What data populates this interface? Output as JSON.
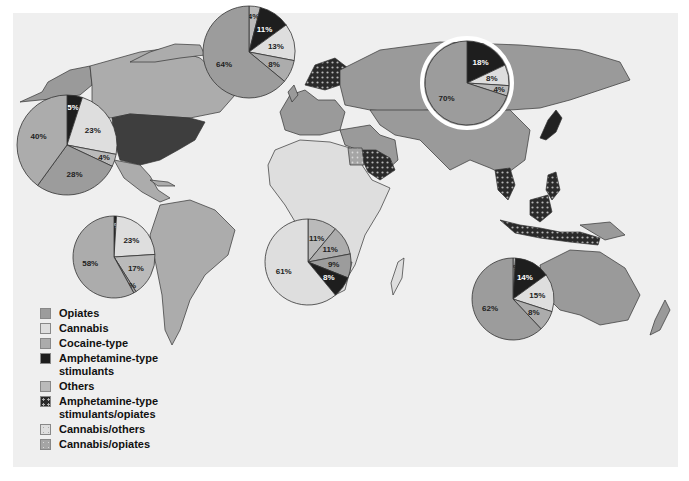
{
  "colors": {
    "background": "#efefef",
    "opiates": "#9c9c9c",
    "cannabis": "#dedede",
    "cocaine": "#acacac",
    "amphetamine": "#1e1e1e",
    "others": "#bababa",
    "ocean": "#efefef",
    "border": "#333333",
    "highlight_ring": "#ffffff"
  },
  "legend": {
    "items": [
      {
        "label": "Opiates",
        "swatch": "opiates"
      },
      {
        "label": "Cannabis",
        "swatch": "cannabis"
      },
      {
        "label": "Cocaine-type",
        "swatch": "cocaine"
      },
      {
        "label": "Amphetamine-type stimulants",
        "line1": "Amphetamine-type",
        "line2": "stimulants",
        "swatch": "amphetamine"
      },
      {
        "label": "Others",
        "swatch": "others"
      },
      {
        "label": "Amphetamine-type stimulants/opiates",
        "line1": "Amphetamine-type",
        "line2": "stimulants/opiates",
        "swatch": "amphetamine-opiates-dotted"
      },
      {
        "label": "Cannabis/others",
        "swatch": "cannabis-others-dotted"
      },
      {
        "label": "Cannabis/opiates",
        "swatch": "cannabis-opiates-dotted"
      }
    ]
  },
  "chart_data": {
    "type": "pie",
    "title": "",
    "categories": [
      "Amphetamine-type stimulants",
      "Cannabis",
      "Others",
      "Opiates",
      "Cocaine-type"
    ],
    "pies": [
      {
        "region": "North America",
        "center": [
          67,
          145
        ],
        "radius": 50,
        "slices": [
          {
            "category": "Amphetamine-type stimulants",
            "value": 5,
            "label": "5%"
          },
          {
            "category": "Cannabis",
            "value": 23,
            "label": "23%"
          },
          {
            "category": "Others",
            "value": 4,
            "label": "4%"
          },
          {
            "category": "Opiates",
            "value": 28,
            "label": "28%"
          },
          {
            "category": "Cocaine-type",
            "value": 40,
            "label": "40%"
          }
        ]
      },
      {
        "region": "Europe",
        "center": [
          249,
          52
        ],
        "radius": 46,
        "slices": [
          {
            "category": "Others",
            "value": 4,
            "label": "4%"
          },
          {
            "category": "Amphetamine-type stimulants",
            "value": 11,
            "label": "11%"
          },
          {
            "category": "Cannabis",
            "value": 13,
            "label": "13%"
          },
          {
            "category": "Cocaine-type",
            "value": 8,
            "label": "8%"
          },
          {
            "category": "Opiates",
            "value": 64,
            "label": "64%"
          }
        ]
      },
      {
        "region": "Asia",
        "center": [
          467,
          83
        ],
        "radius": 42,
        "highlighted": true,
        "slices": [
          {
            "category": "Amphetamine-type stimulants",
            "value": 18,
            "label": "18%"
          },
          {
            "category": "Cannabis",
            "value": 8,
            "label": "8%"
          },
          {
            "category": "Others",
            "value": 4,
            "label": "4%"
          },
          {
            "category": "Opiates",
            "value": 70,
            "label": "70%"
          }
        ]
      },
      {
        "region": "South America",
        "center": [
          114,
          257
        ],
        "radius": 41,
        "slices": [
          {
            "category": "Amphetamine-type stimulants",
            "value": 1,
            "label": "1%"
          },
          {
            "category": "Cannabis",
            "value": 23,
            "label": "23%"
          },
          {
            "category": "Others",
            "value": 17,
            "label": "17%"
          },
          {
            "category": "Opiates",
            "value": 1,
            "label": "1%"
          },
          {
            "category": "Cocaine-type",
            "value": 58,
            "label": "58%"
          }
        ]
      },
      {
        "region": "Africa",
        "center": [
          308,
          262
        ],
        "radius": 43,
        "slices": [
          {
            "category": "Others",
            "value": 11,
            "label": "11%"
          },
          {
            "category": "Cocaine-type",
            "value": 11,
            "label": "11%"
          },
          {
            "category": "Opiates",
            "value": 9,
            "label": "9%"
          },
          {
            "category": "Amphetamine-type stimulants",
            "value": 8,
            "label": "8%"
          },
          {
            "category": "Cannabis",
            "value": 61,
            "label": "61%"
          }
        ]
      },
      {
        "region": "Oceania",
        "center": [
          513,
          299
        ],
        "radius": 41,
        "slices": [
          {
            "category": "Others",
            "value": 1,
            "label": "1%"
          },
          {
            "category": "Amphetamine-type stimulants",
            "value": 14,
            "label": "14%"
          },
          {
            "category": "Cannabis",
            "value": 15,
            "label": "15%"
          },
          {
            "category": "Cocaine-type",
            "value": 8,
            "label": "8%"
          },
          {
            "category": "Opiates",
            "value": 62,
            "label": "62%"
          }
        ]
      }
    ],
    "map_regions": {
      "opiates": [
        "Europe",
        "Russia",
        "Central Asia",
        "Middle East",
        "Southeast Asia (part)",
        "Oceania"
      ],
      "cannabis": [
        "Africa (most)"
      ],
      "cocaine": [
        "Canada",
        "Central America",
        "South America"
      ],
      "amphetamine": [
        "United States",
        "Japan"
      ],
      "amphetamine_opiates": [
        "Scandinavia",
        "Saudi Arabia",
        "Thailand",
        "Philippines",
        "Indonesia"
      ],
      "cannabis_others": [
        "South Africa region"
      ],
      "cannabis_opiates": [
        "Egypt"
      ]
    }
  }
}
